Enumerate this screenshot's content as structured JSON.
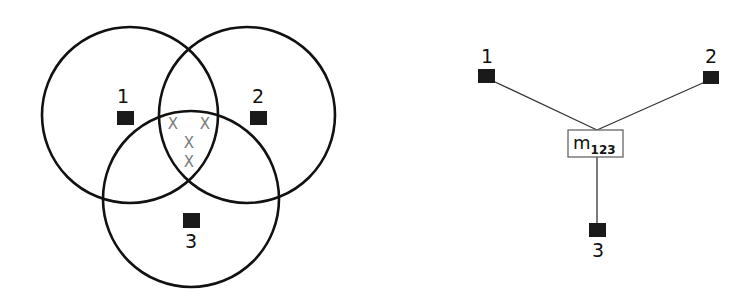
{
  "venn": {
    "circles": [
      {
        "id": "1",
        "cx": 130,
        "cy": 115,
        "r": 88
      },
      {
        "id": "2",
        "cx": 247,
        "cy": 115,
        "r": 88
      },
      {
        "id": "3",
        "cx": 191,
        "cy": 199,
        "r": 88
      }
    ],
    "nodes": [
      {
        "label": "1",
        "label_x": 123,
        "label_y": 103,
        "sq_x": 117,
        "sq_y": 111,
        "sq_w": 17,
        "sq_h": 14
      },
      {
        "label": "2",
        "label_x": 258,
        "label_y": 103,
        "sq_x": 250,
        "sq_y": 111,
        "sq_w": 17,
        "sq_h": 14
      },
      {
        "label": "3",
        "label_x": 191,
        "label_y": 248,
        "sq_x": 183,
        "sq_y": 213,
        "sq_w": 17,
        "sq_h": 15
      }
    ],
    "intersection_marks": [
      {
        "symbol": "X",
        "x": 173,
        "y": 129
      },
      {
        "symbol": "X",
        "x": 205,
        "y": 129
      },
      {
        "symbol": "X",
        "x": 189,
        "y": 148
      },
      {
        "symbol": "X",
        "x": 189,
        "y": 167
      }
    ],
    "mark_color": "#7a7a7a"
  },
  "graph": {
    "nodes": [
      {
        "label": "1",
        "label_x": 487,
        "label_y": 63,
        "sq_x": 478,
        "sq_y": 69,
        "sq_w": 17,
        "sq_h": 14
      },
      {
        "label": "2",
        "label_x": 711,
        "label_y": 63,
        "sq_x": 703,
        "sq_y": 71,
        "sq_w": 16,
        "sq_h": 13
      },
      {
        "label": "3",
        "label_x": 598,
        "label_y": 257,
        "sq_x": 589,
        "sq_y": 223,
        "sq_w": 17,
        "sq_h": 14
      }
    ],
    "center_node": {
      "main": "m",
      "subscript": "123",
      "box_x": 568,
      "box_y": 130,
      "box_w": 55,
      "box_h": 27
    },
    "edges": [
      {
        "from": "1",
        "to": "m123",
        "x1": 493,
        "y1": 81,
        "x2": 597,
        "y2": 130
      },
      {
        "from": "2",
        "to": "m123",
        "x1": 705,
        "y1": 82,
        "x2": 597,
        "y2": 130
      },
      {
        "from": "m123",
        "to": "3",
        "x1": 597,
        "y1": 157,
        "x2": 597,
        "y2": 223
      }
    ]
  }
}
